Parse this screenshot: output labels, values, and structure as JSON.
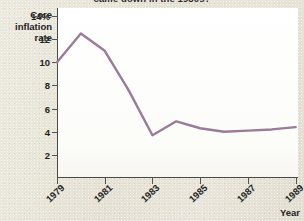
{
  "figure": {
    "background_color": "#e7e3d7",
    "plot_background_color": "#fdfdfb",
    "axis_color": "#4a4a46"
  },
  "chart_data": {
    "type": "line",
    "title": "came down in the 1980s?",
    "xlabel": "Year",
    "ylabel": "Core inflation rate",
    "x": [
      1979,
      1980,
      1981,
      1982,
      1983,
      1984,
      1985,
      1986,
      1987,
      1988,
      1989
    ],
    "series": [
      {
        "name": "Core inflation rate",
        "color": "#9a7b98",
        "values": [
          10.0,
          12.5,
          11.0,
          7.6,
          3.7,
          4.9,
          4.3,
          4.0,
          4.1,
          4.2,
          4.4
        ]
      }
    ],
    "xlim": [
      1979,
      1989.1
    ],
    "ylim": [
      0,
      14.7
    ],
    "xticks": [
      1979,
      1981,
      1983,
      1985,
      1987,
      1989
    ],
    "xticklabels": [
      "1979",
      "1981",
      "1983",
      "1985",
      "1987",
      "1989"
    ],
    "yticks": [
      2,
      4,
      6,
      8,
      10,
      12,
      14
    ],
    "yticklabels": [
      "2",
      "4",
      "6",
      "8",
      "10",
      "12",
      "14%"
    ],
    "grid": false,
    "legend": null,
    "annotations": []
  },
  "axes": {
    "y_title_lines": [
      "Core",
      "inflation",
      "rate"
    ],
    "y_ticks": [
      {
        "label": "14%",
        "value": 14
      },
      {
        "label": "12",
        "value": 12
      },
      {
        "label": "10",
        "value": 10
      },
      {
        "label": "8",
        "value": 8
      },
      {
        "label": "6",
        "value": 6
      },
      {
        "label": "4",
        "value": 4
      },
      {
        "label": "2",
        "value": 2
      }
    ],
    "x_ticks": [
      {
        "label": "1979",
        "value": 1979
      },
      {
        "label": "1981",
        "value": 1981
      },
      {
        "label": "1983",
        "value": 1983
      },
      {
        "label": "1985",
        "value": 1985
      },
      {
        "label": "1987",
        "value": 1987
      },
      {
        "label": "1989",
        "value": 1989
      }
    ],
    "x_title": "Year"
  }
}
